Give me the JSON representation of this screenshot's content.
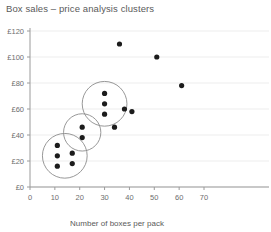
{
  "chart_data": {
    "type": "scatter",
    "title": "Box sales – price analysis clusters",
    "xlabel": "Number of boxes per pack",
    "ylabel": "",
    "xlim": [
      0,
      70
    ],
    "ylim": [
      0,
      120
    ],
    "grid": true,
    "legend": "none",
    "xticks": [
      0,
      10,
      20,
      30,
      40,
      50,
      60,
      70
    ],
    "xtick_labels": [
      "0",
      "10",
      "20",
      "30",
      "40",
      "50",
      "60",
      "70"
    ],
    "yticks": [
      0,
      20,
      40,
      60,
      80,
      100,
      120
    ],
    "ytick_labels": [
      "£0",
      "£20",
      "£40",
      "£60",
      "£80",
      "£100",
      "£120"
    ],
    "point_color": "#1c1c1c",
    "cluster_ring_color": "#8c8c8c",
    "grid_color": "#ededed",
    "axis_color": "#9a9a9a",
    "points": [
      {
        "x": 11,
        "y": 32
      },
      {
        "x": 11,
        "y": 24
      },
      {
        "x": 11,
        "y": 16
      },
      {
        "x": 17,
        "y": 26
      },
      {
        "x": 17,
        "y": 18
      },
      {
        "x": 21,
        "y": 46
      },
      {
        "x": 21,
        "y": 38
      },
      {
        "x": 30,
        "y": 72
      },
      {
        "x": 30,
        "y": 64
      },
      {
        "x": 30,
        "y": 56
      },
      {
        "x": 34,
        "y": 46
      },
      {
        "x": 36,
        "y": 110
      },
      {
        "x": 38,
        "y": 60
      },
      {
        "x": 41,
        "y": 58
      },
      {
        "x": 51,
        "y": 100
      },
      {
        "x": 61,
        "y": 78
      }
    ],
    "clusters": [
      {
        "name": "cluster-low",
        "cx": 14,
        "cy": 24,
        "r_x": 9,
        "members": [
          {
            "x": 11,
            "y": 32
          },
          {
            "x": 11,
            "y": 24
          },
          {
            "x": 11,
            "y": 16
          },
          {
            "x": 17,
            "y": 26
          },
          {
            "x": 17,
            "y": 18
          }
        ]
      },
      {
        "name": "cluster-mid",
        "cx": 21,
        "cy": 42,
        "r_x": 7.5,
        "members": [
          {
            "x": 21,
            "y": 46
          },
          {
            "x": 21,
            "y": 38
          }
        ]
      },
      {
        "name": "cluster-high",
        "cx": 30,
        "cy": 64,
        "r_x": 9,
        "members": [
          {
            "x": 30,
            "y": 72
          },
          {
            "x": 30,
            "y": 64
          },
          {
            "x": 30,
            "y": 56
          }
        ]
      }
    ]
  }
}
